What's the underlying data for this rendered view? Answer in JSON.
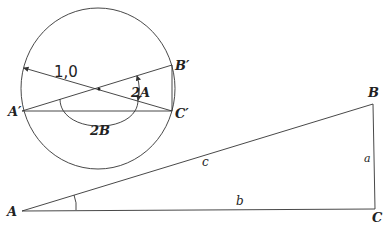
{
  "diagram": {
    "type": "geometry",
    "unit_circle": {
      "radius_label": "1,0",
      "points": {
        "a_prime": "A′",
        "b_prime": "B′",
        "c_prime": "C′"
      },
      "angle_labels": {
        "two_a": "2A",
        "two_b": "2B"
      }
    },
    "triangle": {
      "vertices": {
        "a": "A",
        "b": "B",
        "c": "C"
      },
      "sides": {
        "a": "a",
        "b": "b",
        "c": "c"
      }
    },
    "colors": {
      "stroke": "#333333",
      "background": "#ffffff"
    }
  }
}
